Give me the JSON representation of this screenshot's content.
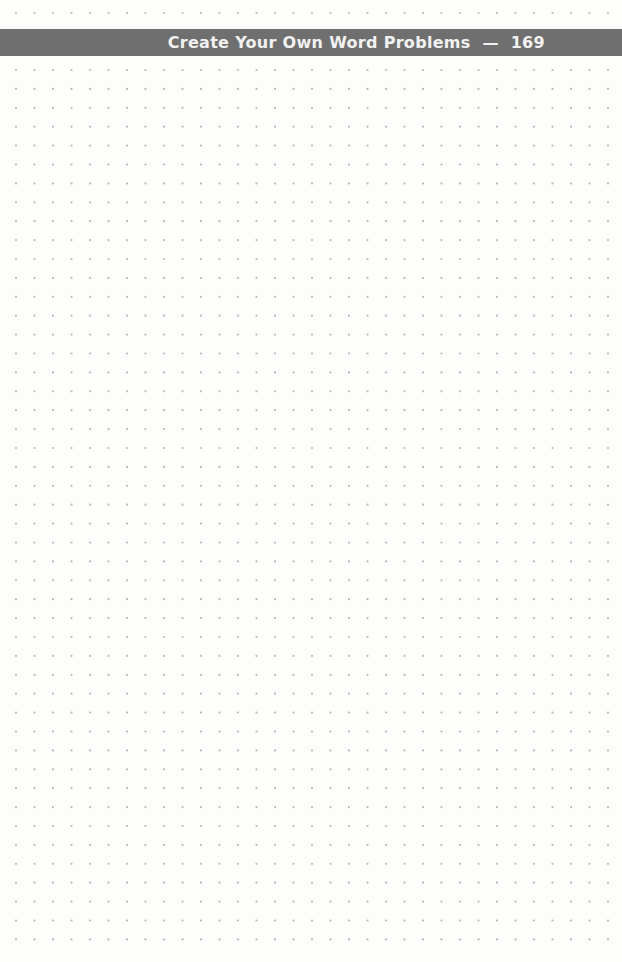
{
  "header": {
    "title": "Create Your Own Word Problems",
    "separator": "—",
    "page_number": "169",
    "band_color": "#6f6f6f",
    "text_color": "#f2f2f2"
  },
  "grid": {
    "type": "dot-grid",
    "dot_color": "#b8b8b8",
    "x_start": 16,
    "x_step": 18.5,
    "columns": 33,
    "top_row_y": 13,
    "y_start": 70,
    "y_step": 18.9,
    "rows": 48
  }
}
